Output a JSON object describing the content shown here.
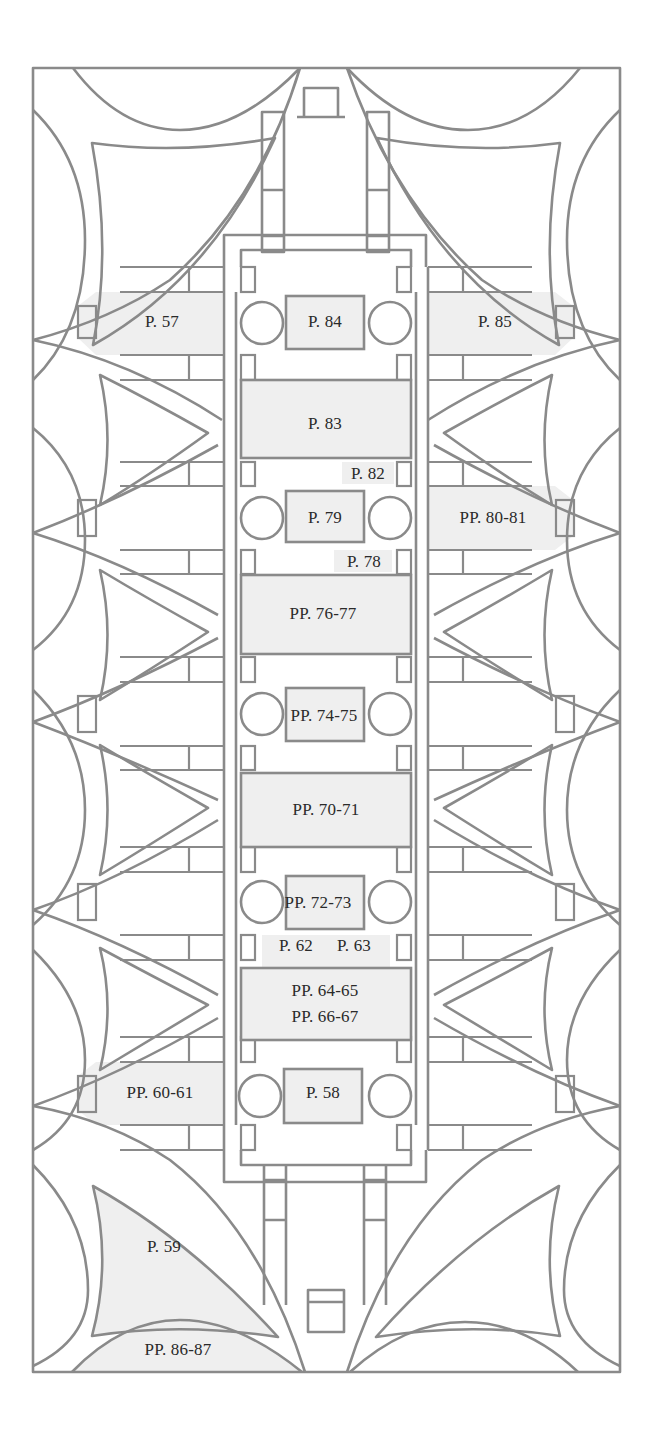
{
  "diagram": {
    "type": "architectural-floor-plan",
    "colors": {
      "wall": "#8a8a8a",
      "highlight_fill": "#efefef",
      "background": "#ffffff",
      "text": "#2a2a2a"
    }
  },
  "labels": {
    "p57": "P. 57",
    "p84": "P. 84",
    "p85": "P. 85",
    "p83": "P. 83",
    "p82": "P. 82",
    "p79": "P. 79",
    "pp80_81": "PP. 80-81",
    "p78": "P. 78",
    "pp76_77": "PP. 76-77",
    "pp74_75": "PP. 74-75",
    "pp70_71": "PP. 70-71",
    "pp72_73": "PP. 72-73",
    "p62": "P. 62",
    "p63": "P. 63",
    "pp64_65": "PP. 64-65",
    "pp66_67": "PP. 66-67",
    "pp60_61": "PP. 60-61",
    "p58": "P. 58",
    "p59": "P. 59",
    "pp86_87": "PP. 86-87"
  }
}
